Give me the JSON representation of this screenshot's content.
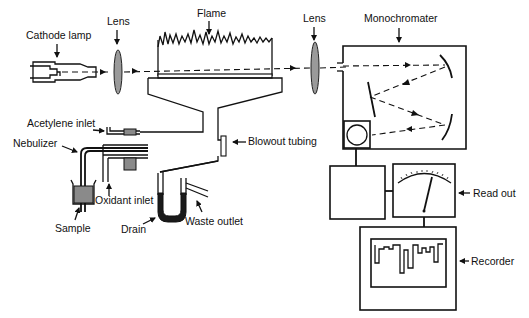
{
  "colors": {
    "line": "#111111",
    "lens_fill": "#9a9a9a",
    "shaded_fill": "#8a8a8a",
    "liquid_fill": "#1a1a1a",
    "background": "#ffffff"
  },
  "labels": {
    "cathode_lamp": "Cathode lamp",
    "lens_left": "Lens",
    "flame": "Flame",
    "lens_right": "Lens",
    "monochromater": "Monochromater",
    "acetylene_inlet": "Acetylene inlet",
    "nebulizer": "Nebulizer",
    "blowout_tubing": "Blowout tubing",
    "oxidant_inlet": "Oxidant inlet",
    "sample": "Sample",
    "drain": "Drain",
    "waste_outlet": "Waste outlet",
    "read_out": "Read out",
    "recorder": "Recorder"
  },
  "components": [
    {
      "id": "cathode-lamp",
      "label": "Cathode lamp"
    },
    {
      "id": "lens-1",
      "label": "Lens"
    },
    {
      "id": "burner-flame",
      "label": "Flame"
    },
    {
      "id": "lens-2",
      "label": "Lens"
    },
    {
      "id": "monochromator",
      "label": "Monochromater"
    },
    {
      "id": "detector",
      "label": ""
    },
    {
      "id": "amplifier",
      "label": ""
    },
    {
      "id": "meter",
      "label": "Read out"
    },
    {
      "id": "chart-recorder",
      "label": "Recorder"
    }
  ],
  "connections": [
    {
      "from": "cathode-lamp",
      "to": "lens-1",
      "style": "dashed-beam"
    },
    {
      "from": "lens-1",
      "to": "burner-flame",
      "style": "dashed-beam"
    },
    {
      "from": "burner-flame",
      "to": "lens-2",
      "style": "dashed-beam"
    },
    {
      "from": "lens-2",
      "to": "monochromator",
      "style": "dashed-beam"
    },
    {
      "from": "detector",
      "to": "amplifier",
      "style": "wire"
    },
    {
      "from": "amplifier",
      "to": "meter",
      "style": "wire"
    },
    {
      "from": "meter",
      "to": "chart-recorder",
      "style": "wire"
    }
  ]
}
